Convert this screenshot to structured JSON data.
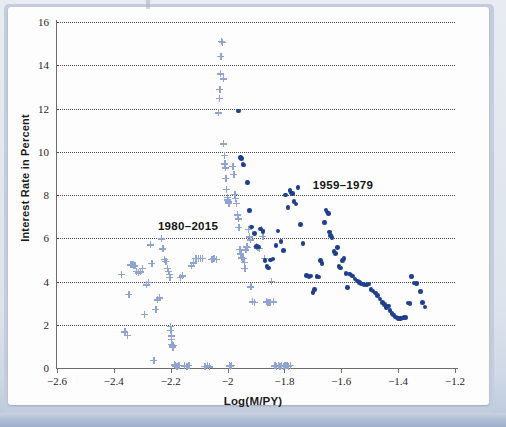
{
  "figure": {
    "background_color": "#e3e8f0",
    "card_color": "#fdfdfd"
  },
  "annotations": [
    {
      "text": "1980–2015",
      "x": -2.245,
      "y": 6.85
    },
    {
      "text": "1959–1979",
      "x": -1.7,
      "y": 8.75
    }
  ],
  "chart_data": {
    "type": "scatter",
    "title": "",
    "xlabel": "Log(M/PY)",
    "ylabel": "Interest Rate in Percent",
    "xlim": [
      -2.6,
      -1.2
    ],
    "ylim": [
      0,
      16
    ],
    "xticks": [
      -2.6,
      -2.4,
      -2.2,
      -2.0,
      -1.8,
      -1.6,
      -1.4,
      -1.2
    ],
    "xtick_labels": [
      "−2.6",
      "−2.4",
      "−2.2",
      "−2",
      "−1.8",
      "−1.6",
      "−1.4",
      "−1.2"
    ],
    "yticks": [
      0,
      2,
      4,
      6,
      8,
      10,
      12,
      14,
      16
    ],
    "ytick_labels": [
      "0",
      "2",
      "4",
      "6",
      "8",
      "10",
      "12",
      "14",
      "16"
    ],
    "grid": "horizontal-dotted",
    "legend": "inline-annotations",
    "series": [
      {
        "name": "1980–2015",
        "marker": "plus",
        "color": "#8fa4d4",
        "points": [
          [
            -2.373,
            4.32
          ],
          [
            -2.362,
            1.68
          ],
          [
            -2.352,
            1.52
          ],
          [
            -2.348,
            3.4
          ],
          [
            -2.341,
            4.78
          ],
          [
            -2.334,
            4.8
          ],
          [
            -2.33,
            4.74
          ],
          [
            -2.326,
            4.72
          ],
          [
            -2.32,
            4.46
          ],
          [
            -2.313,
            4.4
          ],
          [
            -2.306,
            4.44
          ],
          [
            -2.299,
            4.62
          ],
          [
            -2.292,
            2.48
          ],
          [
            -2.285,
            3.84
          ],
          [
            -2.278,
            3.96
          ],
          [
            -2.272,
            5.7
          ],
          [
            -2.266,
            4.84
          ],
          [
            -2.26,
            0.36
          ],
          [
            -2.253,
            2.72
          ],
          [
            -2.247,
            3.16
          ],
          [
            -2.24,
            3.24
          ],
          [
            -2.234,
            5.98
          ],
          [
            -2.228,
            5.52
          ],
          [
            -2.222,
            5.04
          ],
          [
            -2.217,
            4.92
          ],
          [
            -2.212,
            4.62
          ],
          [
            -2.208,
            4.48
          ],
          [
            -2.205,
            4.34
          ],
          [
            -2.203,
            4.18
          ],
          [
            -2.201,
            1.92
          ],
          [
            -2.199,
            1.74
          ],
          [
            -2.198,
            1.48
          ],
          [
            -2.197,
            1.32
          ],
          [
            -2.196,
            1.1
          ],
          [
            -2.195,
            1.02
          ],
          [
            -2.193,
            0.96
          ],
          [
            -2.191,
            1.06
          ],
          [
            -2.188,
            0.14
          ],
          [
            -2.184,
            0.1
          ],
          [
            -2.178,
            0.08
          ],
          [
            -2.172,
            0.12
          ],
          [
            -2.166,
            4.18
          ],
          [
            -2.16,
            4.26
          ],
          [
            -2.152,
            0.1
          ],
          [
            -2.144,
            0.08
          ],
          [
            -2.136,
            0.12
          ],
          [
            -2.128,
            4.72
          ],
          [
            -2.12,
            4.86
          ],
          [
            -2.112,
            5.06
          ],
          [
            -2.104,
            5.06
          ],
          [
            -2.096,
            5.08
          ],
          [
            -2.088,
            5.06
          ],
          [
            -2.08,
            0.08
          ],
          [
            -2.072,
            0.1
          ],
          [
            -2.064,
            0.06
          ],
          [
            -2.056,
            5.02
          ],
          [
            -2.048,
            5.06
          ],
          [
            -2.04,
            5.02
          ],
          [
            -2.032,
            11.8
          ],
          [
            -2.03,
            12.48
          ],
          [
            -2.028,
            12.88
          ],
          [
            -2.026,
            13.6
          ],
          [
            -2.024,
            14.4
          ],
          [
            -2.022,
            15.12
          ],
          [
            -2.018,
            15.06
          ],
          [
            -2.016,
            13.38
          ],
          [
            -2.014,
            10.36
          ],
          [
            -2.012,
            9.84
          ],
          [
            -2.01,
            9.44
          ],
          [
            -2.008,
            9.26
          ],
          [
            -2.006,
            8.78
          ],
          [
            -2.004,
            8.26
          ],
          [
            -2.002,
            7.88
          ],
          [
            -2.0,
            7.78
          ],
          [
            -1.998,
            7.68
          ],
          [
            -1.996,
            7.62
          ],
          [
            -1.994,
            0.1
          ],
          [
            -1.99,
            0.08
          ],
          [
            -1.986,
            0.12
          ],
          [
            -1.982,
            9.34
          ],
          [
            -1.978,
            8.96
          ],
          [
            -1.975,
            8.04
          ],
          [
            -1.972,
            7.86
          ],
          [
            -1.969,
            7.62
          ],
          [
            -1.966,
            7.08
          ],
          [
            -1.963,
            6.9
          ],
          [
            -1.96,
            6.52
          ],
          [
            -1.957,
            5.48
          ],
          [
            -1.954,
            5.28
          ],
          [
            -1.951,
            5.1
          ],
          [
            -1.948,
            5.08
          ],
          [
            -1.945,
            5.06
          ],
          [
            -1.942,
            4.9
          ],
          [
            -1.939,
            4.62
          ],
          [
            -1.936,
            5.46
          ],
          [
            -1.933,
            5.6
          ],
          [
            -1.93,
            5.58
          ],
          [
            -1.927,
            6.42
          ],
          [
            -1.924,
            6.06
          ],
          [
            -1.921,
            5.92
          ],
          [
            -1.918,
            3.76
          ],
          [
            -1.912,
            3.06
          ],
          [
            -1.906,
            3.04
          ],
          [
            -1.9,
            5.62
          ],
          [
            -1.894,
            5.56
          ],
          [
            -1.888,
            5.54
          ],
          [
            -1.882,
            6.4
          ],
          [
            -1.876,
            6.1
          ],
          [
            -1.87,
            5.08
          ],
          [
            -1.864,
            3.06
          ],
          [
            -1.858,
            3.04
          ],
          [
            -1.852,
            3.04
          ],
          [
            -1.846,
            4.0
          ],
          [
            -1.84,
            3.06
          ],
          [
            -1.834,
            0.1
          ],
          [
            -1.828,
            0.08
          ],
          [
            -1.822,
            0.12
          ],
          [
            -1.816,
            0.08
          ],
          [
            -1.81,
            0.1
          ],
          [
            -1.804,
            0.08
          ],
          [
            -1.798,
            0.12
          ],
          [
            -1.792,
            0.1
          ],
          [
            -1.786,
            0.08
          ],
          [
            -1.78,
            0.12
          ]
        ]
      },
      {
        "name": "1959–1979",
        "marker": "circle",
        "color": "#1f3f91",
        "points": [
          [
            -1.962,
            11.88
          ],
          [
            -1.954,
            9.74
          ],
          [
            -1.95,
            9.7
          ],
          [
            -1.946,
            9.42
          ],
          [
            -1.942,
            9.38
          ],
          [
            -1.93,
            8.58
          ],
          [
            -1.922,
            7.28
          ],
          [
            -1.916,
            6.52
          ],
          [
            -1.906,
            6.22
          ],
          [
            -1.898,
            5.62
          ],
          [
            -1.89,
            5.6
          ],
          [
            -1.884,
            6.42
          ],
          [
            -1.876,
            6.3
          ],
          [
            -1.868,
            4.96
          ],
          [
            -1.862,
            4.7
          ],
          [
            -1.856,
            4.62
          ],
          [
            -1.848,
            5.0
          ],
          [
            -1.84,
            5.04
          ],
          [
            -1.83,
            5.66
          ],
          [
            -1.822,
            6.34
          ],
          [
            -1.812,
            5.86
          ],
          [
            -1.804,
            5.44
          ],
          [
            -1.796,
            8.0
          ],
          [
            -1.788,
            7.42
          ],
          [
            -1.78,
            8.2
          ],
          [
            -1.776,
            8.1
          ],
          [
            -1.772,
            8.06
          ],
          [
            -1.766,
            7.7
          ],
          [
            -1.76,
            7.58
          ],
          [
            -1.752,
            8.34
          ],
          [
            -1.744,
            6.64
          ],
          [
            -1.734,
            5.76
          ],
          [
            -1.722,
            4.28
          ],
          [
            -1.714,
            4.24
          ],
          [
            -1.706,
            4.26
          ],
          [
            -1.7,
            3.5
          ],
          [
            -1.694,
            3.62
          ],
          [
            -1.686,
            4.24
          ],
          [
            -1.68,
            4.2
          ],
          [
            -1.674,
            4.98
          ],
          [
            -1.668,
            4.82
          ],
          [
            -1.66,
            6.72
          ],
          [
            -1.654,
            7.3
          ],
          [
            -1.65,
            7.22
          ],
          [
            -1.646,
            7.14
          ],
          [
            -1.642,
            6.28
          ],
          [
            -1.638,
            6.12
          ],
          [
            -1.632,
            6.04
          ],
          [
            -1.626,
            5.4
          ],
          [
            -1.62,
            5.3
          ],
          [
            -1.614,
            5.56
          ],
          [
            -1.608,
            4.7
          ],
          [
            -1.602,
            4.62
          ],
          [
            -1.596,
            4.96
          ],
          [
            -1.59,
            5.06
          ],
          [
            -1.584,
            4.38
          ],
          [
            -1.578,
            3.72
          ],
          [
            -1.572,
            4.34
          ],
          [
            -1.566,
            4.3
          ],
          [
            -1.56,
            4.26
          ],
          [
            -1.552,
            4.12
          ],
          [
            -1.544,
            4.02
          ],
          [
            -1.536,
            3.96
          ],
          [
            -1.528,
            3.88
          ],
          [
            -1.52,
            3.86
          ],
          [
            -1.512,
            3.84
          ],
          [
            -1.504,
            3.88
          ],
          [
            -1.496,
            3.62
          ],
          [
            -1.488,
            3.56
          ],
          [
            -1.48,
            3.46
          ],
          [
            -1.472,
            3.34
          ],
          [
            -1.464,
            3.2
          ],
          [
            -1.456,
            3.04
          ],
          [
            -1.448,
            2.94
          ],
          [
            -1.44,
            2.8
          ],
          [
            -1.434,
            2.86
          ],
          [
            -1.428,
            2.66
          ],
          [
            -1.422,
            2.52
          ],
          [
            -1.416,
            2.46
          ],
          [
            -1.41,
            2.36
          ],
          [
            -1.404,
            2.32
          ],
          [
            -1.398,
            2.3
          ],
          [
            -1.392,
            2.3
          ],
          [
            -1.386,
            2.32
          ],
          [
            -1.38,
            2.34
          ],
          [
            -1.374,
            2.34
          ],
          [
            -1.366,
            3.0
          ],
          [
            -1.358,
            2.98
          ],
          [
            -1.352,
            4.24
          ],
          [
            -1.344,
            3.94
          ],
          [
            -1.336,
            3.9
          ],
          [
            -1.322,
            3.54
          ],
          [
            -1.314,
            3.02
          ],
          [
            -1.306,
            2.82
          ]
        ]
      }
    ]
  }
}
